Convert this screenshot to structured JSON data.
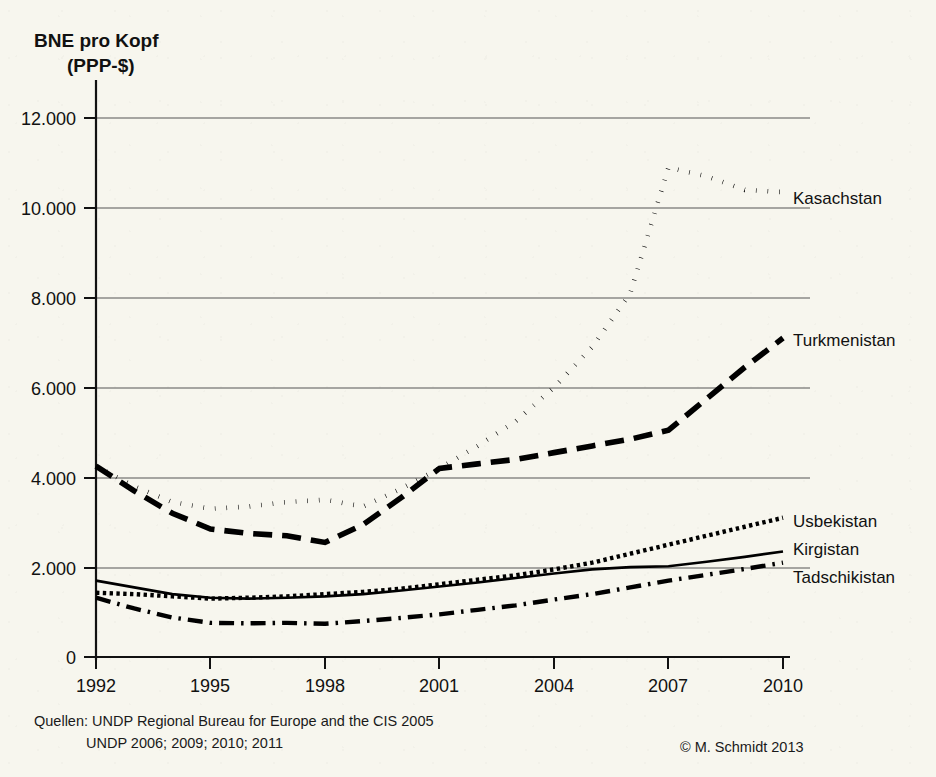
{
  "title_lines": [
    "BNE pro Kopf",
    "(PPP-$)"
  ],
  "source": {
    "line1": "Quellen:  UNDP Regional Bureau for Europe and the CIS 2005",
    "line2": "UNDP 2006; 2009; 2010; 2011",
    "copyright": "© M. Schmidt 2013"
  },
  "axes": {
    "y_tick_labels": [
      "0",
      "2.000",
      "4.000",
      "6.000",
      "8.000",
      "10.000",
      "12.000"
    ],
    "x_tick_labels": [
      "1992",
      "1995",
      "1998",
      "2001",
      "2004",
      "2007",
      "2010"
    ]
  },
  "series_labels": {
    "kasachstan": "Kasachstan",
    "turkmenistan": "Turkmenistan",
    "usbekistan": "Usbekistan",
    "kirgistan": "Kirgistan",
    "tadschikistan": "Tadschikistan"
  },
  "chart_data": {
    "type": "line",
    "title": "BNE pro Kopf (PPP-$)",
    "xlabel": "",
    "ylabel": "BNE pro Kopf (PPP-$)",
    "xlim": [
      1992,
      2010
    ],
    "ylim": [
      0,
      12000
    ],
    "y_ticks": [
      0,
      2000,
      4000,
      6000,
      8000,
      10000,
      12000
    ],
    "x_ticks": [
      1992,
      1995,
      1998,
      2001,
      2004,
      2007,
      2010
    ],
    "grid": "horizontal",
    "legend_position": "right-inline-labels",
    "x": [
      1992,
      1993,
      1994,
      1995,
      1996,
      1997,
      1998,
      1999,
      2000,
      2001,
      2002,
      2003,
      2004,
      2005,
      2006,
      2007,
      2008,
      2009,
      2010
    ],
    "series": [
      {
        "name": "Kasachstan",
        "style": "dotted",
        "color": "#000000",
        "values": [
          4250,
          3800,
          3450,
          3300,
          3350,
          3450,
          3500,
          3350,
          3750,
          4200,
          4700,
          5250,
          6000,
          6900,
          8100,
          10900,
          10700,
          10400,
          10350
        ]
      },
      {
        "name": "Turkmenistan",
        "style": "dashed",
        "color": "#000000",
        "values": [
          4250,
          3700,
          3200,
          2850,
          2750,
          2700,
          2550,
          2950,
          3550,
          4200,
          4300,
          4400,
          4550,
          4700,
          4850,
          5050,
          5750,
          6450,
          7100
        ]
      },
      {
        "name": "Usbekistan",
        "style": "dotted-fine",
        "color": "#000000",
        "values": [
          1430,
          1400,
          1350,
          1300,
          1320,
          1350,
          1400,
          1450,
          1520,
          1620,
          1720,
          1820,
          1950,
          2100,
          2300,
          2500,
          2700,
          2900,
          3100
        ]
      },
      {
        "name": "Kirgistan",
        "style": "solid",
        "color": "#000000",
        "values": [
          1700,
          1550,
          1400,
          1320,
          1300,
          1320,
          1350,
          1400,
          1480,
          1570,
          1660,
          1760,
          1860,
          1950,
          2000,
          2020,
          2120,
          2230,
          2350
        ]
      },
      {
        "name": "Tadschikistan",
        "style": "dash-dot",
        "color": "#000000",
        "values": [
          1320,
          1080,
          880,
          760,
          750,
          760,
          740,
          800,
          870,
          950,
          1050,
          1150,
          1280,
          1400,
          1550,
          1700,
          1830,
          1960,
          2100
        ]
      }
    ]
  },
  "plot_geometry": {
    "x_left_px": 96,
    "x_right_px": 783,
    "y_zero_px": 657,
    "y_top_px": 118
  }
}
